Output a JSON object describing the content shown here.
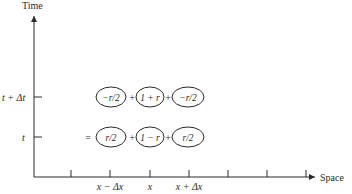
{
  "axes": {
    "y_label": "Time",
    "x_label": "Space",
    "y_ticks": [
      {
        "label": "t + Δt",
        "y": 97
      },
      {
        "label": "t",
        "y": 137
      }
    ],
    "x_ticks": [
      {
        "label": "",
        "x": 71
      },
      {
        "label": "x − Δx",
        "x": 110
      },
      {
        "label": "x",
        "x": 150
      },
      {
        "label": "x + Δx",
        "x": 189
      },
      {
        "label": "",
        "x": 228
      },
      {
        "label": "",
        "x": 267
      },
      {
        "label": "",
        "x": 306
      }
    ]
  },
  "rows": {
    "top": {
      "prefix": "",
      "terms": [
        "−r/2",
        "1 + r",
        "−r/2"
      ],
      "operators": [
        "+",
        "+"
      ]
    },
    "bottom": {
      "prefix": "=",
      "terms": [
        "r/2",
        "1 − r",
        "r/2"
      ],
      "operators": [
        "+",
        "+"
      ]
    }
  },
  "colors": {
    "ink": "#2a2a2a",
    "background": "#ffffff"
  }
}
